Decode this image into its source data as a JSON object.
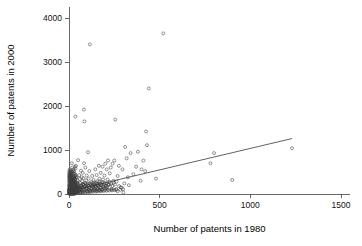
{
  "chart_data": {
    "type": "scatter",
    "title": "",
    "xlabel": "Number of patents in 1980",
    "ylabel": "Number of patents in 2000",
    "xlim": [
      0,
      1550
    ],
    "ylim": [
      0,
      4250
    ],
    "xticks": [
      0,
      500,
      1000,
      1500
    ],
    "xticklabels": [
      "0",
      "500",
      "1000",
      "1500"
    ],
    "yticks": [
      0,
      1000,
      2000,
      3000,
      4000
    ],
    "yticklabels": [
      "0",
      "1000",
      "2000",
      "3000",
      "4000"
    ],
    "grid": false,
    "legend": null,
    "marker": "open-circle",
    "marker_color": "#3c3c3c",
    "fit_line": {
      "label": "linear fit",
      "x_start": 10,
      "y_start": 70,
      "x_end": 1230,
      "y_end": 1260,
      "color": "#3a3a3a"
    },
    "points": [
      [
        1230,
        1040
      ],
      [
        900,
        320
      ],
      [
        800,
        930
      ],
      [
        780,
        700
      ],
      [
        520,
        3650
      ],
      [
        480,
        350
      ],
      [
        440,
        2400
      ],
      [
        430,
        1110
      ],
      [
        425,
        1420
      ],
      [
        420,
        520
      ],
      [
        410,
        760
      ],
      [
        400,
        560
      ],
      [
        395,
        300
      ],
      [
        380,
        960
      ],
      [
        370,
        620
      ],
      [
        355,
        450
      ],
      [
        340,
        930
      ],
      [
        330,
        200
      ],
      [
        325,
        380
      ],
      [
        318,
        810
      ],
      [
        310,
        1070
      ],
      [
        305,
        240
      ],
      [
        300,
        35
      ],
      [
        295,
        560
      ],
      [
        285,
        150
      ],
      [
        275,
        640
      ],
      [
        268,
        410
      ],
      [
        262,
        95
      ],
      [
        255,
        1690
      ],
      [
        250,
        760
      ],
      [
        245,
        300
      ],
      [
        240,
        690
      ],
      [
        235,
        120
      ],
      [
        230,
        600
      ],
      [
        225,
        470
      ],
      [
        220,
        220
      ],
      [
        215,
        760
      ],
      [
        212,
        330
      ],
      [
        208,
        560
      ],
      [
        205,
        130
      ],
      [
        200,
        690
      ],
      [
        198,
        250
      ],
      [
        195,
        420
      ],
      [
        190,
        180
      ],
      [
        188,
        330
      ],
      [
        185,
        620
      ],
      [
        182,
        90
      ],
      [
        178,
        260
      ],
      [
        175,
        480
      ],
      [
        172,
        150
      ],
      [
        168,
        350
      ],
      [
        165,
        640
      ],
      [
        162,
        210
      ],
      [
        158,
        110
      ],
      [
        155,
        290
      ],
      [
        152,
        430
      ],
      [
        148,
        170
      ],
      [
        145,
        560
      ],
      [
        142,
        240
      ],
      [
        138,
        95
      ],
      [
        135,
        320
      ],
      [
        132,
        200
      ],
      [
        128,
        410
      ],
      [
        125,
        140
      ],
      [
        122,
        270
      ],
      [
        118,
        80
      ],
      [
        115,
        3400
      ],
      [
        112,
        520
      ],
      [
        110,
        190
      ],
      [
        108,
        350
      ],
      [
        105,
        950
      ],
      [
        102,
        240
      ],
      [
        100,
        130
      ],
      [
        98,
        420
      ],
      [
        95,
        310
      ],
      [
        92,
        180
      ],
      [
        90,
        600
      ],
      [
        88,
        250
      ],
      [
        85,
        1650
      ],
      [
        83,
        700
      ],
      [
        82,
        1920
      ],
      [
        80,
        360
      ],
      [
        78,
        220
      ],
      [
        76,
        480
      ],
      [
        74,
        140
      ],
      [
        72,
        290
      ],
      [
        70,
        380
      ],
      [
        68,
        190
      ],
      [
        66,
        530
      ],
      [
        64,
        120
      ],
      [
        62,
        250
      ],
      [
        60,
        340
      ],
      [
        58,
        90
      ],
      [
        56,
        430
      ],
      [
        54,
        200
      ],
      [
        52,
        160
      ],
      [
        50,
        770
      ],
      [
        48,
        300
      ],
      [
        46,
        110
      ],
      [
        44,
        260
      ],
      [
        42,
        380
      ],
      [
        40,
        170
      ],
      [
        38,
        640
      ],
      [
        36,
        230
      ],
      [
        35,
        1760
      ],
      [
        34,
        100
      ],
      [
        33,
        320
      ],
      [
        32,
        190
      ],
      [
        31,
        450
      ],
      [
        30,
        130
      ],
      [
        29,
        270
      ],
      [
        28,
        210
      ],
      [
        27,
        360
      ],
      [
        26,
        90
      ],
      [
        25,
        300
      ],
      [
        24,
        160
      ],
      [
        23,
        480
      ],
      [
        22,
        230
      ],
      [
        21,
        120
      ],
      [
        20,
        290
      ],
      [
        19,
        200
      ],
      [
        18,
        350
      ],
      [
        17,
        140
      ],
      [
        16,
        260
      ],
      [
        15,
        180
      ],
      [
        14,
        420
      ],
      [
        13,
        110
      ],
      [
        12,
        240
      ],
      [
        11,
        170
      ],
      [
        10,
        310
      ],
      [
        9,
        130
      ],
      [
        8,
        220
      ],
      [
        7,
        90
      ],
      [
        6,
        280
      ],
      [
        5,
        160
      ],
      [
        4,
        200
      ],
      [
        3,
        120
      ],
      [
        2,
        250
      ],
      [
        1,
        80
      ],
      [
        0,
        180
      ],
      [
        12,
        510
      ],
      [
        18,
        600
      ],
      [
        8,
        450
      ],
      [
        25,
        560
      ],
      [
        33,
        620
      ],
      [
        16,
        700
      ],
      [
        28,
        520
      ],
      [
        6,
        380
      ],
      [
        14,
        330
      ],
      [
        22,
        400
      ],
      [
        4,
        290
      ],
      [
        10,
        350
      ],
      [
        30,
        470
      ],
      [
        20,
        530
      ],
      [
        36,
        580
      ],
      [
        5,
        60
      ],
      [
        9,
        50
      ],
      [
        13,
        70
      ],
      [
        17,
        45
      ],
      [
        21,
        65
      ],
      [
        26,
        55
      ],
      [
        31,
        75
      ],
      [
        37,
        40
      ],
      [
        43,
        60
      ],
      [
        49,
        85
      ],
      [
        3,
        40
      ],
      [
        7,
        30
      ],
      [
        11,
        55
      ],
      [
        15,
        35
      ],
      [
        19,
        50
      ],
      [
        24,
        45
      ],
      [
        29,
        60
      ],
      [
        34,
        38
      ],
      [
        39,
        52
      ],
      [
        45,
        42
      ],
      [
        2,
        25
      ],
      [
        6,
        20
      ],
      [
        10,
        32
      ],
      [
        14,
        28
      ],
      [
        18,
        22
      ],
      [
        23,
        35
      ],
      [
        27,
        30
      ],
      [
        32,
        25
      ],
      [
        38,
        40
      ],
      [
        44,
        30
      ],
      [
        1,
        15
      ],
      [
        5,
        12
      ],
      [
        9,
        18
      ],
      [
        13,
        14
      ],
      [
        17,
        20
      ],
      [
        22,
        16
      ],
      [
        26,
        22
      ],
      [
        30,
        18
      ],
      [
        35,
        12
      ],
      [
        41,
        24
      ],
      [
        47,
        100
      ],
      [
        53,
        140
      ],
      [
        59,
        95
      ],
      [
        65,
        175
      ],
      [
        71,
        120
      ],
      [
        77,
        210
      ],
      [
        84,
        160
      ],
      [
        91,
        240
      ],
      [
        97,
        110
      ],
      [
        104,
        190
      ],
      [
        111,
        145
      ],
      [
        119,
        230
      ],
      [
        126,
        175
      ],
      [
        133,
        260
      ],
      [
        140,
        200
      ],
      [
        147,
        150
      ],
      [
        154,
        235
      ],
      [
        161,
        190
      ],
      [
        169,
        280
      ],
      [
        176,
        215
      ],
      [
        50,
        55
      ],
      [
        57,
        75
      ],
      [
        63,
        45
      ],
      [
        69,
        90
      ],
      [
        75,
        65
      ],
      [
        81,
        105
      ],
      [
        87,
        80
      ],
      [
        94,
        125
      ],
      [
        101,
        60
      ],
      [
        109,
        95
      ],
      [
        116,
        70
      ],
      [
        124,
        115
      ],
      [
        131,
        85
      ],
      [
        139,
        130
      ],
      [
        146,
        100
      ],
      [
        153,
        75
      ],
      [
        160,
        120
      ],
      [
        167,
        95
      ],
      [
        174,
        140
      ],
      [
        181,
        110
      ],
      [
        189,
        165
      ],
      [
        196,
        135
      ],
      [
        203,
        185
      ],
      [
        210,
        155
      ],
      [
        218,
        205
      ],
      [
        0,
        40
      ],
      [
        0,
        90
      ],
      [
        0,
        25
      ],
      [
        1,
        60
      ],
      [
        1,
        110
      ],
      [
        2,
        75
      ],
      [
        2,
        140
      ],
      [
        3,
        95
      ],
      [
        3,
        55
      ],
      [
        4,
        130
      ],
      [
        5,
        85
      ],
      [
        6,
        150
      ],
      [
        7,
        105
      ],
      [
        8,
        70
      ],
      [
        9,
        165
      ],
      [
        10,
        115
      ],
      [
        11,
        80
      ],
      [
        12,
        190
      ],
      [
        13,
        135
      ],
      [
        14,
        95
      ],
      [
        15,
        210
      ],
      [
        16,
        150
      ],
      [
        17,
        105
      ],
      [
        18,
        240
      ],
      [
        19,
        170
      ],
      [
        20,
        120
      ],
      [
        21,
        260
      ],
      [
        22,
        185
      ],
      [
        23,
        135
      ],
      [
        24,
        280
      ],
      [
        25,
        200
      ],
      [
        26,
        145
      ],
      [
        27,
        300
      ],
      [
        28,
        215
      ],
      [
        29,
        160
      ],
      [
        30,
        90
      ],
      [
        31,
        230
      ],
      [
        32,
        170
      ],
      [
        33,
        110
      ],
      [
        34,
        250
      ],
      [
        35,
        180
      ],
      [
        36,
        125
      ],
      [
        37,
        270
      ],
      [
        38,
        195
      ],
      [
        39,
        140
      ],
      [
        40,
        100
      ],
      [
        41,
        215
      ],
      [
        42,
        155
      ],
      [
        43,
        105
      ],
      [
        44,
        235
      ],
      [
        45,
        165
      ],
      [
        46,
        115
      ],
      [
        47,
        255
      ],
      [
        48,
        185
      ],
      [
        49,
        125
      ],
      [
        2,
        5
      ],
      [
        4,
        8
      ],
      [
        6,
        3
      ],
      [
        8,
        12
      ],
      [
        10,
        6
      ],
      [
        12,
        10
      ],
      [
        14,
        4
      ],
      [
        16,
        15
      ],
      [
        18,
        8
      ],
      [
        20,
        5
      ],
      [
        22,
        11
      ],
      [
        24,
        7
      ],
      [
        26,
        14
      ],
      [
        28,
        9
      ],
      [
        30,
        6
      ],
      [
        1,
        200
      ],
      [
        3,
        230
      ],
      [
        5,
        260
      ],
      [
        7,
        180
      ],
      [
        9,
        290
      ],
      [
        11,
        250
      ],
      [
        13,
        310
      ],
      [
        15,
        270
      ],
      [
        17,
        330
      ],
      [
        19,
        240
      ],
      [
        21,
        350
      ],
      [
        23,
        290
      ],
      [
        25,
        370
      ],
      [
        27,
        310
      ],
      [
        29,
        390
      ],
      [
        31,
        340
      ],
      [
        33,
        410
      ],
      [
        35,
        360
      ],
      [
        37,
        430
      ],
      [
        39,
        380
      ],
      [
        55,
        170
      ],
      [
        60,
        130
      ],
      [
        66,
        200
      ],
      [
        73,
        155
      ],
      [
        79,
        225
      ],
      [
        86,
        185
      ],
      [
        93,
        145
      ],
      [
        99,
        215
      ],
      [
        106,
        175
      ],
      [
        113,
        245
      ],
      [
        121,
        195
      ],
      [
        129,
        160
      ],
      [
        136,
        225
      ],
      [
        143,
        185
      ],
      [
        150,
        255
      ],
      [
        157,
        205
      ],
      [
        164,
        165
      ],
      [
        171,
        235
      ],
      [
        179,
        195
      ],
      [
        186,
        265
      ],
      [
        193,
        215
      ],
      [
        201,
        175
      ],
      [
        209,
        245
      ],
      [
        216,
        205
      ],
      [
        224,
        275
      ],
      [
        232,
        225
      ],
      [
        239,
        185
      ],
      [
        247,
        255
      ],
      [
        254,
        215
      ],
      [
        263,
        285
      ],
      [
        52,
        20
      ],
      [
        58,
        35
      ],
      [
        64,
        25
      ],
      [
        70,
        45
      ],
      [
        77,
        30
      ],
      [
        83,
        50
      ],
      [
        89,
        28
      ],
      [
        96,
        55
      ],
      [
        103,
        38
      ],
      [
        110,
        60
      ],
      [
        117,
        42
      ],
      [
        125,
        65
      ],
      [
        132,
        48
      ],
      [
        141,
        70
      ],
      [
        149,
        52
      ],
      [
        156,
        75
      ],
      [
        163,
        58
      ],
      [
        170,
        80
      ],
      [
        177,
        62
      ],
      [
        184,
        85
      ],
      [
        192,
        68
      ],
      [
        199,
        90
      ],
      [
        207,
        72
      ],
      [
        214,
        95
      ],
      [
        222,
        78
      ],
      [
        230,
        100
      ],
      [
        237,
        82
      ],
      [
        245,
        105
      ],
      [
        252,
        88
      ],
      [
        260,
        110
      ],
      [
        268,
        60
      ],
      [
        276,
        180
      ],
      [
        283,
        95
      ],
      [
        291,
        145
      ],
      [
        298,
        110
      ],
      [
        0,
        300
      ],
      [
        0,
        420
      ],
      [
        1,
        380
      ],
      [
        1,
        480
      ],
      [
        2,
        350
      ],
      [
        2,
        520
      ],
      [
        3,
        400
      ],
      [
        3,
        450
      ],
      [
        4,
        330
      ],
      [
        4,
        560
      ],
      [
        5,
        370
      ],
      [
        5,
        440
      ],
      [
        6,
        320
      ],
      [
        6,
        490
      ],
      [
        7,
        410
      ],
      [
        8,
        340
      ],
      [
        8,
        530
      ],
      [
        9,
        390
      ],
      [
        10,
        460
      ],
      [
        11,
        360
      ],
      [
        12,
        430
      ],
      [
        13,
        500
      ],
      [
        14,
        380
      ],
      [
        15,
        450
      ],
      [
        16,
        340
      ]
    ]
  },
  "axis": {
    "x_axis_name": "x-axis",
    "y_axis_name": "y-axis"
  }
}
